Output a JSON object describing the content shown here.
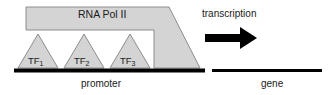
{
  "figure": {
    "background_color": "#ffffff"
  },
  "colors": {
    "shape_fill": "#d4d4d4",
    "shape_stroke": "#8c8c8c",
    "dna_line": "#000000",
    "arrow": "#000000",
    "text": "#1a1a1a"
  },
  "shapes": {
    "polymerase": {
      "label": "RNA Pol II",
      "name": "rna-polymerase-ii-shape",
      "fill": "#d4d4d4",
      "stroke": "#8c8c8c",
      "points": "26,7 169,7 200,68 154,68 154,30 26,30"
    },
    "transcription_factors": [
      {
        "label": "TF",
        "subscript": "1",
        "name": "transcription-factor-1",
        "points": "38,34 58,68 18,68"
      },
      {
        "label": "TF",
        "subscript": "2",
        "name": "transcription-factor-2",
        "points": "84,34 104,68 64,68"
      },
      {
        "label": "TF",
        "subscript": "3",
        "name": "transcription-factor-3",
        "points": "130,34 150,68 110,68"
      }
    ],
    "dna_segments": [
      {
        "name": "promoter-dna-line",
        "label": "promoter",
        "x1": 14,
        "x2": 205,
        "y": 70,
        "thickness": 4
      },
      {
        "name": "gene-dna-line",
        "label": "gene",
        "x1": 212,
        "x2": 322,
        "y": 70,
        "thickness": 3
      }
    ],
    "arrow": {
      "name": "transcription-arrow",
      "label": "transcription",
      "shaft": {
        "x": 205,
        "y": 34,
        "width": 36,
        "height": 8
      },
      "head": "241,28 255,38 241,48"
    }
  },
  "labels": {
    "polymerase": "RNA Pol II",
    "transcription": "transcription",
    "promoter": "promoter",
    "gene": "gene",
    "tf1": "TF",
    "tf1_sub": "1",
    "tf2": "TF",
    "tf2_sub": "2",
    "tf3": "TF",
    "tf3_sub": "3"
  }
}
